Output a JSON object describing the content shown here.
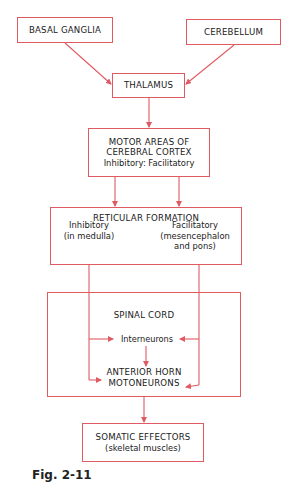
{
  "colors": {
    "line": "#e05a62",
    "text": "#1a1a1a",
    "background": "#ffffff"
  },
  "nodes": {
    "basal_ganglia": {
      "label": "BASAL GANGLIA"
    },
    "cerebellum": {
      "label": "CEREBELLUM"
    },
    "thalamus": {
      "label": "THALAMUS"
    },
    "motor_areas": {
      "line1": "MOTOR AREAS OF",
      "line2": "CEREBRAL CORTEX",
      "line3": "Inhibitory: Facilitatory"
    },
    "reticular_formation": {
      "title": "RETICULAR FORMATION",
      "inhibitory": {
        "line1": "Inhibitory",
        "line2": "(in medulla)"
      },
      "facilitatory": {
        "line1": "Facilitatory",
        "line2": "(mesencephalon",
        "line3": "and pons)"
      }
    },
    "spinal_cord": {
      "title": "SPINAL CORD",
      "interneurons": "Interneurons",
      "anterior_horn": {
        "line1": "ANTERIOR HORN",
        "line2": "MOTONEURONS"
      }
    },
    "somatic_effectors": {
      "line1": "SOMATIC EFFECTORS",
      "line2": "(skeletal muscles)"
    }
  },
  "edges": [
    {
      "from": "basal_ganglia",
      "to": "thalamus"
    },
    {
      "from": "cerebellum",
      "to": "thalamus"
    },
    {
      "from": "thalamus",
      "to": "motor_areas"
    },
    {
      "from": "motor_areas.inhibitory",
      "to": "reticular_formation.inhibitory"
    },
    {
      "from": "motor_areas.facilitatory",
      "to": "reticular_formation.facilitatory"
    },
    {
      "from": "reticular_formation.inhibitory",
      "to": "spinal_cord.interneurons"
    },
    {
      "from": "reticular_formation.inhibitory",
      "to": "spinal_cord.anterior_horn"
    },
    {
      "from": "reticular_formation.facilitatory",
      "to": "spinal_cord.interneurons"
    },
    {
      "from": "reticular_formation.facilitatory",
      "to": "spinal_cord.anterior_horn"
    },
    {
      "from": "spinal_cord.interneurons",
      "to": "spinal_cord.anterior_horn"
    },
    {
      "from": "spinal_cord",
      "to": "somatic_effectors"
    }
  ],
  "caption": "Fig. 2-11"
}
